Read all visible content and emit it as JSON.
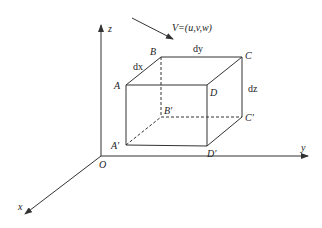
{
  "diagram": {
    "title": "",
    "axes": {
      "origin_label": "O",
      "x_label": "x",
      "y_label": "y",
      "z_label": "z"
    },
    "velocity_label": "V=(u,v,w)",
    "vertices": {
      "A": "A",
      "B": "B",
      "C": "C",
      "D": "D",
      "A_prime": "A′",
      "B_prime": "B′",
      "C_prime": "C′",
      "D_prime": "D′"
    },
    "edge_labels": {
      "dx": "dx",
      "dy": "dy",
      "dz": "dz"
    },
    "colors": {
      "line": "#333333",
      "background": "#ffffff"
    }
  }
}
